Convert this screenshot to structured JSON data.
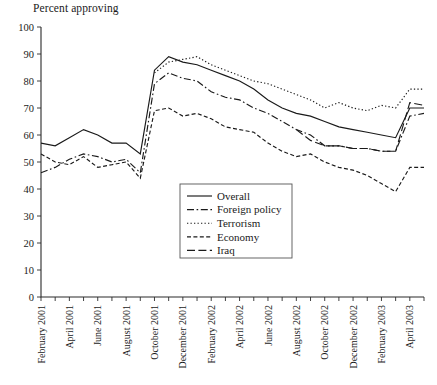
{
  "chart": {
    "title": "",
    "axis_note": "Percent approving",
    "ylabel": "Percent approving",
    "xlabel": ""
  },
  "legend": {
    "position": "center",
    "items": [
      {
        "label": "Overall",
        "style": "solid"
      },
      {
        "label": "Foreign policy",
        "style": "dashdot"
      },
      {
        "label": "Terrorism",
        "style": "dotted"
      },
      {
        "label": "Economy",
        "style": "dashed-short"
      },
      {
        "label": "Iraq",
        "style": "dashed-long"
      }
    ]
  },
  "yaxis": {
    "ticks": [
      "0",
      "10",
      "20",
      "30",
      "40",
      "50",
      "60",
      "70",
      "80",
      "90",
      "100"
    ],
    "min": 0,
    "max": 100,
    "step": 10
  },
  "xaxis": {
    "labels": [
      "February 2001",
      "April 2001",
      "June 2001",
      "August 2001",
      "October 2001",
      "December 2001",
      "February 2002",
      "April 2002",
      "June 2002",
      "August 2002",
      "October 2002",
      "December 2002",
      "February 2003",
      "April 2003"
    ],
    "label_interval_months": 2,
    "tick_interval_months": 1
  },
  "chart_data": {
    "type": "line",
    "title": "Percent approving",
    "xlabel": "",
    "ylabel": "Percent approving",
    "ylim": [
      0,
      100
    ],
    "grid": false,
    "legend_position": "center",
    "x": [
      "February 2001",
      "March 2001",
      "April 2001",
      "May 2001",
      "June 2001",
      "July 2001",
      "August 2001",
      "September 2001",
      "October 2001",
      "November 2001",
      "December 2001",
      "January 2002",
      "February 2002",
      "March 2002",
      "April 2002",
      "May 2002",
      "June 2002",
      "July 2002",
      "August 2002",
      "September 2002",
      "October 2002",
      "November 2002",
      "December 2002",
      "January 2003",
      "February 2003",
      "March 2003",
      "April 2003",
      "May 2003"
    ],
    "series": [
      {
        "name": "Overall",
        "style": "solid",
        "values": [
          57,
          56,
          59,
          62,
          60,
          57,
          57,
          53,
          84,
          89,
          87,
          86,
          84,
          82,
          80,
          77,
          73,
          70,
          68,
          67,
          65,
          63,
          62,
          61,
          60,
          59,
          70,
          70
        ]
      },
      {
        "name": "Foreign policy",
        "style": "dashdot",
        "values": [
          46,
          48,
          51,
          53,
          52,
          50,
          51,
          46,
          79,
          83,
          81,
          80,
          76,
          74,
          73,
          70,
          68,
          65,
          62,
          60,
          56,
          56,
          55,
          55,
          54,
          54,
          67,
          68
        ]
      },
      {
        "name": "Terrorism",
        "style": "dotted",
        "values": [
          null,
          null,
          null,
          null,
          null,
          null,
          null,
          null,
          83,
          87,
          88,
          89,
          86,
          84,
          82,
          80,
          79,
          77,
          75,
          73,
          70,
          72,
          70,
          69,
          71,
          70,
          77,
          77
        ]
      },
      {
        "name": "Economy",
        "style": "dashed-short",
        "values": [
          53,
          50,
          49,
          52,
          48,
          49,
          50,
          44,
          69,
          70,
          67,
          68,
          66,
          63,
          62,
          61,
          57,
          54,
          52,
          53,
          50,
          48,
          47,
          45,
          42,
          39,
          48,
          48
        ]
      },
      {
        "name": "Iraq",
        "style": "dashed-long",
        "values": [
          null,
          null,
          null,
          null,
          null,
          null,
          null,
          null,
          null,
          null,
          null,
          null,
          null,
          null,
          null,
          null,
          null,
          null,
          62,
          58,
          56,
          56,
          55,
          55,
          54,
          54,
          72,
          71
        ]
      }
    ]
  }
}
